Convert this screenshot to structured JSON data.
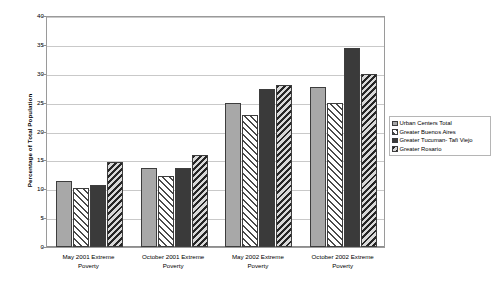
{
  "chart_data": {
    "type": "bar",
    "title": "",
    "xlabel": "",
    "ylabel": "Percentage of Total Population",
    "ylim": [
      0,
      40
    ],
    "ytick_step": 5,
    "yticks": [
      0,
      5,
      10,
      15,
      20,
      25,
      30,
      35,
      40
    ],
    "grid": true,
    "legend_position": "right",
    "categories": [
      "May 2001 Extreme Poverty",
      "October 2001 Extreme Poverty",
      "May 2002 Extreme Poverty",
      "October 2002 Extreme Poverty"
    ],
    "category_lines": [
      [
        "May 2001 Extreme",
        "Poverty"
      ],
      [
        "October 2001 Extreme",
        "Poverty"
      ],
      [
        "May 2002 Extreme",
        "Poverty"
      ],
      [
        "October 2002 Extreme",
        "Poverty"
      ]
    ],
    "series": [
      {
        "name": "Urban Centers Total",
        "pattern": "solid-light-gray",
        "color": "#a8a8a8",
        "values": [
          11.5,
          13.7,
          25.0,
          27.7
        ]
      },
      {
        "name": "Greater Buenos Aires",
        "pattern": "diagonal-hatch-forward",
        "color": "#ffffff",
        "values": [
          10.3,
          12.3,
          22.8,
          25.0
        ]
      },
      {
        "name": "Greater Tucuman- Tafi Viejo",
        "pattern": "solid-dark",
        "color": "#3a3a3a",
        "values": [
          10.8,
          13.7,
          27.4,
          34.4
        ]
      },
      {
        "name": "Greater Rosario",
        "pattern": "diagonal-hatch-back",
        "color": "#8e8e8e",
        "values": [
          14.7,
          16.0,
          28.1,
          30.0
        ]
      }
    ]
  },
  "legend": {
    "items": [
      "Urban Centers Total",
      "Greater Buenos Aires",
      "Greater Tucuman- Tafi Viejo",
      "Greater Rosario"
    ]
  }
}
